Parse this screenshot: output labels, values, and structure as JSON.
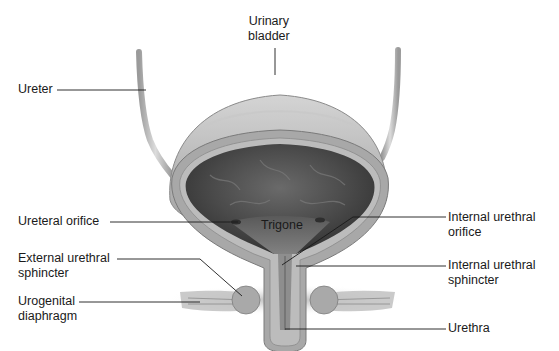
{
  "figure": {
    "colors": {
      "background": "#ffffff",
      "outer_wall": "#b9b9b9",
      "wall_muscle": "#9a9a9a",
      "lumen_dark": "#4a4a4a",
      "leader_line": "#1a1a1a",
      "text": "#1a1a1a"
    }
  },
  "labels": {
    "urinary_bladder": {
      "line1": "Urinary",
      "line2": "bladder"
    },
    "ureter": {
      "line1": "Ureter"
    },
    "ureteral_orifice": {
      "line1": "Ureteral orifice"
    },
    "trigone": {
      "line1": "Trigone"
    },
    "external_urethral_sphincter": {
      "line1": "External urethral",
      "line2": "sphincter"
    },
    "urogenital_diaphragm": {
      "line1": "Urogenital",
      "line2": "diaphragm"
    },
    "internal_urethral_orifice": {
      "line1": "Internal urethral",
      "line2": "orifice"
    },
    "internal_urethral_sphincter": {
      "line1": "Internal urethral",
      "line2": "sphincter"
    },
    "urethra": {
      "line1": "Urethra"
    }
  }
}
